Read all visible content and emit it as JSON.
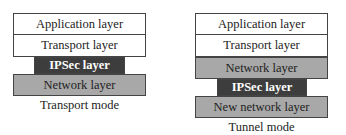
{
  "transport_mode": {
    "layers": [
      "Application layer",
      "Transport layer",
      "IPSec layer",
      "Network layer"
    ],
    "caption": "Transport mode"
  },
  "tunnel_mode": {
    "layers": [
      "Application layer",
      "Transport layer",
      "Network layer",
      "IPSec layer",
      "New network layer"
    ],
    "caption": "Tunnel mode"
  }
}
